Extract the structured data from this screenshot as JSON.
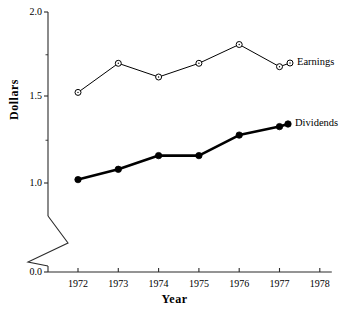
{
  "chart_data": {
    "type": "line",
    "title": "",
    "xlabel": "Year",
    "ylabel": "Dollars",
    "x": [
      1972,
      1973,
      1974,
      1975,
      1976,
      1977
    ],
    "xtick_labels": [
      "1972",
      "1973",
      "1974",
      "1975",
      "1976",
      "1977",
      "1978"
    ],
    "xlim": [
      1971.5,
      1978.2
    ],
    "ytick_labels": [
      "0.0",
      "1.0",
      "1.5",
      "2.0"
    ],
    "ytick_values": [
      0.0,
      1.0,
      1.5,
      2.0
    ],
    "ylim": [
      0.0,
      2.0
    ],
    "y_axis_break": true,
    "y_axis_break_between": [
      0.0,
      1.0
    ],
    "grid": false,
    "legend_position": "inline-right",
    "series": [
      {
        "name": "Earnings",
        "marker": "open-circle",
        "color": "#000000",
        "line_width": "thin",
        "values": [
          1.53,
          1.7,
          1.62,
          1.7,
          1.81,
          1.68
        ]
      },
      {
        "name": "Dividends",
        "marker": "filled-circle",
        "color": "#000000",
        "line_width": "thick",
        "values": [
          1.02,
          1.08,
          1.16,
          1.16,
          1.28,
          1.33
        ]
      }
    ]
  },
  "axes": {
    "y_title": "Dollars",
    "x_title": "Year"
  }
}
